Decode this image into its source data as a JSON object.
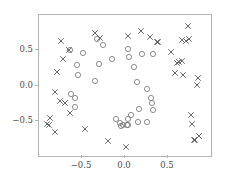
{
  "chart_data": {
    "type": "scatter",
    "title": "",
    "xlabel": "",
    "ylabel": "",
    "xlim": [
      -1.0,
      1.0
    ],
    "ylim": [
      -1.0,
      1.0
    ],
    "grid": false,
    "legend": "none",
    "xticks": [
      -0.5,
      0.0,
      0.5
    ],
    "yticks": [
      -0.5,
      0.0,
      0.5
    ],
    "xticklabels": [
      "-0.5",
      "0.0",
      "0.5"
    ],
    "yticklabels": [
      "-0.5",
      "0.0",
      "0.5"
    ],
    "axes_color": "#b4b4b4",
    "tick_label_color": "#4a4a4a",
    "series": [
      {
        "name": "circle-class",
        "marker": "circle",
        "color": "#808080",
        "points": [
          [
            -0.64,
            0.5
          ],
          [
            -0.49,
            0.46
          ],
          [
            -0.33,
            0.66
          ],
          [
            -0.26,
            0.57
          ],
          [
            -0.15,
            0.38
          ],
          [
            -0.56,
            0.29
          ],
          [
            -0.3,
            0.3
          ],
          [
            -0.55,
            0.145
          ],
          [
            -0.35,
            0.06
          ],
          [
            0.035,
            0.52
          ],
          [
            0.05,
            0.41
          ],
          [
            0.11,
            0.26
          ],
          [
            0.2,
            0.45
          ],
          [
            0.32,
            0.44
          ],
          [
            0.145,
            0.05
          ],
          [
            0.26,
            -0.055
          ],
          [
            0.3,
            -0.175
          ],
          [
            0.31,
            -0.245
          ],
          [
            0.32,
            -0.35
          ],
          [
            0.16,
            -0.33
          ],
          [
            0.075,
            -0.425
          ],
          [
            0.035,
            -0.47
          ],
          [
            0.15,
            -0.52
          ],
          [
            0.255,
            -0.52
          ],
          [
            -0.02,
            -0.555
          ],
          [
            -0.055,
            -0.525
          ],
          [
            -0.045,
            -0.575
          ],
          [
            0.03,
            -0.56
          ],
          [
            0.025,
            -0.565
          ],
          [
            -0.63,
            -0.125
          ],
          [
            -0.585,
            -0.175
          ],
          [
            -0.58,
            -0.3
          ],
          [
            -0.1,
            -0.47
          ]
        ]
      },
      {
        "name": "cross-class",
        "marker": "cross",
        "color": "#595959",
        "points": [
          [
            -0.74,
            0.635
          ],
          [
            -0.655,
            0.505
          ],
          [
            -0.72,
            0.375
          ],
          [
            -0.785,
            0.19
          ],
          [
            -0.35,
            0.745
          ],
          [
            -0.29,
            0.675
          ],
          [
            0.03,
            0.705
          ],
          [
            0.19,
            0.78
          ],
          [
            0.295,
            0.695
          ],
          [
            0.735,
            0.845
          ],
          [
            0.375,
            0.62
          ],
          [
            0.385,
            0.615
          ],
          [
            0.665,
            0.645
          ],
          [
            0.705,
            0.635
          ],
          [
            0.745,
            0.655
          ],
          [
            0.535,
            0.47
          ],
          [
            0.6,
            0.325
          ],
          [
            0.625,
            0.34
          ],
          [
            0.665,
            0.345
          ],
          [
            0.585,
            0.18
          ],
          [
            0.67,
            0.145
          ],
          [
            0.845,
            0.11
          ],
          [
            0.835,
            0.01
          ],
          [
            -0.815,
            -0.095
          ],
          [
            -0.755,
            -0.215
          ],
          [
            -0.7,
            -0.255
          ],
          [
            -0.645,
            -0.39
          ],
          [
            -0.875,
            -0.455
          ],
          [
            -0.91,
            -0.545
          ],
          [
            -0.885,
            -0.555
          ],
          [
            -0.81,
            -0.665
          ],
          [
            -0.46,
            -0.615
          ],
          [
            -0.2,
            -0.785
          ],
          [
            0.015,
            -0.875
          ],
          [
            0.765,
            -0.42
          ],
          [
            0.775,
            -0.545
          ],
          [
            0.86,
            -0.71
          ],
          [
            0.8,
            -0.775
          ],
          [
            0.815,
            -0.78
          ]
        ]
      }
    ]
  }
}
